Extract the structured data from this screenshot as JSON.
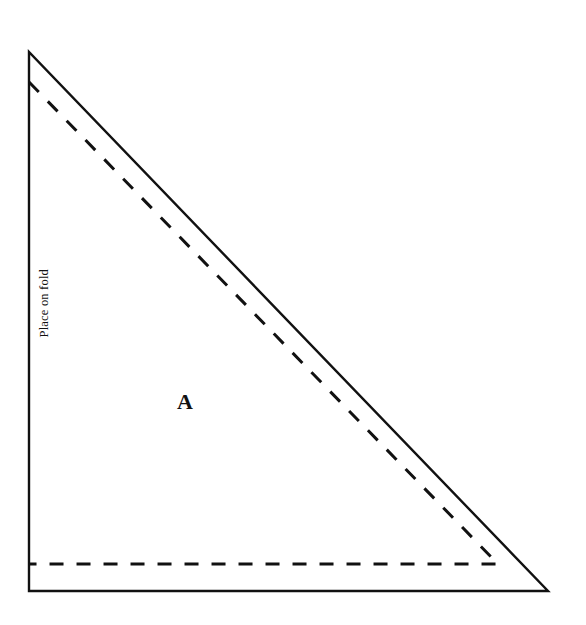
{
  "document": {
    "type": "sewing-pattern-diagram",
    "background_color": "#ffffff",
    "line_color": "#111111",
    "width": 586,
    "height": 625
  },
  "pattern_piece": {
    "letter": "A",
    "shape": "right-triangle",
    "fold_label": "Place on fold",
    "cutting_line": {
      "style": "solid",
      "points": "29,52 29,591 548,591 29,52"
    },
    "seam_line": {
      "style": "dashed",
      "dash_pattern": "14 13",
      "points": "29,82 498,564 29,564"
    }
  },
  "labels": {
    "fold": "Place on fold",
    "piece": "A"
  }
}
